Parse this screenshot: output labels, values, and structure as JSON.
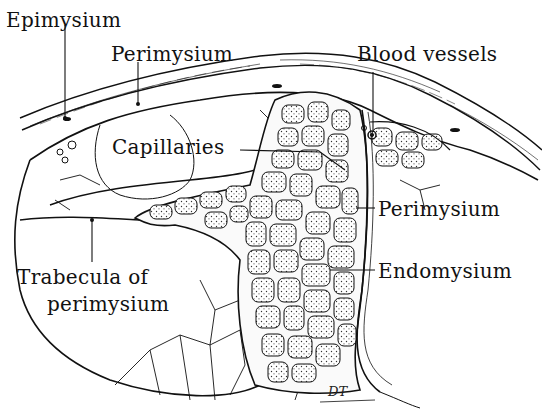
{
  "diagram": {
    "labels": {
      "epimysium": "Epimysium",
      "perimysium_top": "Perimysium",
      "blood_vessels": "Blood vessels",
      "capillaries": "Capillaries",
      "perimysium_right": "Perimysium",
      "endomysium": "Endomysium",
      "trabecula_line1": "Trabecula of",
      "trabecula_line2": "perimysium"
    },
    "signature": "DT",
    "colors": {
      "ink": "#111111",
      "background": "#ffffff",
      "fiber_fill": "#f4f4f4"
    }
  }
}
